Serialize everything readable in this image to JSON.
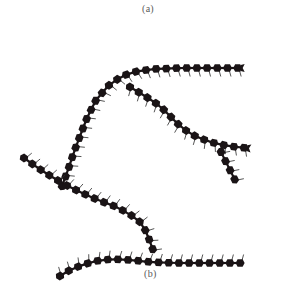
{
  "figure": {
    "label_top": "(a)",
    "label_bottom": "(b)",
    "colors": {
      "bead": "#1a1416",
      "tick": "#2a2a2a",
      "label": "#5a5a5a",
      "background": "#ffffff"
    },
    "bead_size": {
      "w": 9,
      "h": 7.5
    },
    "bead_spacing": 10.2,
    "chains": [
      {
        "name": "main-chain-upper",
        "path": [
          [
            62,
            186
          ],
          [
            68,
            170
          ],
          [
            74,
            152
          ],
          [
            80,
            136
          ],
          [
            87,
            118
          ],
          [
            96,
            100
          ],
          [
            108,
            86
          ],
          [
            122,
            76
          ],
          [
            138,
            71
          ],
          [
            155,
            69
          ],
          [
            180,
            68
          ],
          [
            210,
            68
          ],
          [
            245,
            68
          ]
        ],
        "tick_side": 1,
        "end_cap": true
      },
      {
        "name": "branch-upper-right",
        "path": [
          [
            130,
            87
          ],
          [
            145,
            96
          ],
          [
            160,
            106
          ],
          [
            172,
            118
          ],
          [
            182,
            128
          ],
          [
            195,
            136
          ],
          [
            210,
            142
          ],
          [
            228,
            146
          ],
          [
            246,
            148
          ]
        ],
        "tick_side": 1,
        "end_cap": true
      },
      {
        "name": "branch-sub-right",
        "path": [
          [
            221,
            152
          ],
          [
            226,
            162
          ],
          [
            231,
            172
          ],
          [
            235,
            180
          ]
        ],
        "tick_side": -1,
        "end_cap": false
      },
      {
        "name": "chain-diagonal",
        "path": [
          [
            24,
            158
          ],
          [
            38,
            168
          ],
          [
            52,
            177
          ],
          [
            66,
            185
          ],
          [
            82,
            193
          ],
          [
            98,
            200
          ],
          [
            114,
            206
          ],
          [
            128,
            213
          ],
          [
            140,
            222
          ],
          [
            147,
            233
          ],
          [
            151,
            245
          ],
          [
            154,
            252
          ]
        ],
        "tick_side": -1,
        "end_cap": false
      },
      {
        "name": "chain-bottom",
        "path": [
          [
            60,
            276
          ],
          [
            70,
            270
          ],
          [
            82,
            265
          ],
          [
            96,
            261
          ],
          [
            112,
            259
          ],
          [
            130,
            260
          ],
          [
            150,
            262
          ],
          [
            175,
            263
          ],
          [
            210,
            263
          ],
          [
            248,
            263
          ]
        ],
        "tick_side": -1,
        "end_cap": false
      }
    ]
  }
}
